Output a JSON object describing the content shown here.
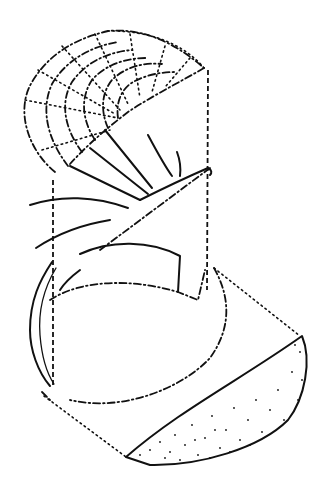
{
  "figure": {
    "colors": {
      "ink": "#111111",
      "background": "#ffffff"
    },
    "parts": [
      "grid-dome",
      "radiating-ribs",
      "middle-lobe",
      "lower-ring",
      "stippled-lobe",
      "construction-lines"
    ]
  }
}
